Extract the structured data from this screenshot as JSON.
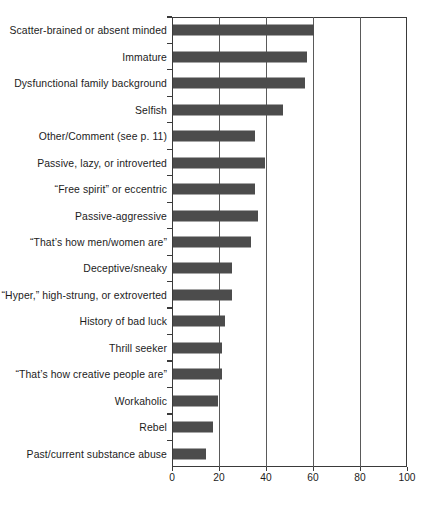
{
  "chart_data": {
    "type": "bar",
    "orientation": "horizontal",
    "title": "",
    "subtitle": "",
    "xlabel": "",
    "ylabel": "",
    "xlim": [
      0,
      100
    ],
    "xticks": [
      0,
      20,
      40,
      60,
      80,
      100
    ],
    "grid": true,
    "grid_axis": "x",
    "legend": false,
    "bar_color": "#4c4c4c",
    "axis_color": "#3a3a3a",
    "background": "#ffffff",
    "categories": [
      "Scatter-brained or absent minded",
      "Immature",
      "Dysfunctional family background",
      "Selfish",
      "Other/Comment (see p. 11)",
      "Passive, lazy, or introverted",
      "“Free spirit” or eccentric",
      "Passive-aggressive",
      "“That’s how men/women are”",
      "Deceptive/sneaky",
      "“Hyper,” high-strung, or extroverted",
      "History of bad luck",
      "Thrill seeker",
      "“That’s how creative people are”",
      "Workaholic",
      "Rebel",
      "Past/current substance abuse"
    ],
    "values": [
      60,
      57,
      56,
      47,
      35,
      39,
      35,
      36,
      33,
      25,
      25,
      22,
      21,
      21,
      19,
      17,
      14
    ]
  }
}
